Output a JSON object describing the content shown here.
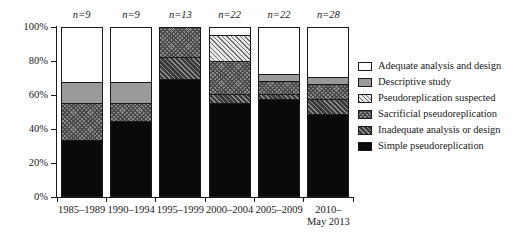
{
  "chart_data": {
    "type": "bar",
    "subtype": "stacked-100-percent",
    "title": "",
    "xlabel": "",
    "ylabel": "",
    "ylim": [
      0,
      100
    ],
    "ytick_labels": [
      "0%",
      "20%",
      "40%",
      "60%",
      "80%",
      "100%"
    ],
    "ytick_values": [
      0,
      20,
      40,
      60,
      80,
      100
    ],
    "grid": false,
    "legend_position": "right",
    "categories": [
      "1985–1989",
      "1990–1994",
      "1995–1999",
      "2000–2004",
      "2005–2009",
      "2010–May 2013"
    ],
    "category_lines": [
      [
        "1985–1989"
      ],
      [
        "1990–1994"
      ],
      [
        "1995–1999"
      ],
      [
        "2000–2004"
      ],
      [
        "2005–2009"
      ],
      [
        "2010–",
        "May 2013"
      ]
    ],
    "sample_sizes": [
      "n=9",
      "n=9",
      "n=13",
      "n=22",
      "n=22",
      "n=28"
    ],
    "series": [
      {
        "name": "Simple pseudoreplication",
        "fill": "solid-black",
        "color": "#0a0a0a",
        "values": [
          33,
          44,
          69,
          55,
          57,
          48
        ]
      },
      {
        "name": "Inadequate analysis or design",
        "fill": "dark-hatch",
        "color": "#3a3a3a",
        "values": [
          0,
          0,
          13,
          5,
          3,
          9
        ]
      },
      {
        "name": "Sacrificial pseudoreplication",
        "fill": "medium-crosshatch",
        "color": "#8a8a8a",
        "values": [
          22,
          11,
          18,
          20,
          8,
          9
        ]
      },
      {
        "name": "Pseudoreplication suspected",
        "fill": "light-hatch",
        "color": "#e8e8e8",
        "values": [
          0,
          0,
          0,
          15,
          0,
          0
        ]
      },
      {
        "name": "Descriptive study",
        "fill": "solid-gray",
        "color": "#9a9a9a",
        "values": [
          12,
          12,
          0,
          0,
          4,
          4
        ]
      },
      {
        "name": "Adequate analysis and design",
        "fill": "white",
        "color": "#ffffff",
        "values": [
          33,
          33,
          0,
          5,
          28,
          30
        ]
      }
    ]
  },
  "legend": {
    "items": [
      {
        "label": "Adequate analysis and design",
        "fill_class": "fill-adequate"
      },
      {
        "label": "Descriptive study",
        "fill_class": "fill-descriptive"
      },
      {
        "label": "Pseudoreplication suspected",
        "fill_class": "fill-suspected"
      },
      {
        "label": "Sacrificial pseudoreplication",
        "fill_class": "fill-sacrificial"
      },
      {
        "label": "Inadequate analysis or design",
        "fill_class": "fill-inadequate"
      },
      {
        "label": "Simple pseudoreplication",
        "fill_class": "fill-simple"
      }
    ]
  }
}
